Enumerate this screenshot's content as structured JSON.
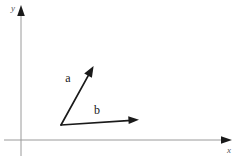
{
  "figure": {
    "type": "vector-diagram",
    "background_color": "#ffffff",
    "width": 242,
    "height": 162,
    "axes": {
      "color": "#9a9a9a",
      "origin": {
        "x": 21,
        "y": 140
      },
      "x_axis": {
        "label": "x",
        "label_position": {
          "x": 229,
          "y": 152
        },
        "start": {
          "x": 4,
          "y": 140
        },
        "end": {
          "x": 226,
          "y": 140
        },
        "arrow": "right"
      },
      "y_axis": {
        "label": "y",
        "label_position": {
          "x": 13,
          "y": 11
        },
        "start": {
          "x": 21,
          "y": 156
        },
        "end": {
          "x": 21,
          "y": 11
        },
        "arrow": "up"
      }
    },
    "vectors": [
      {
        "name": "a",
        "label": "a",
        "label_position": {
          "x": 68,
          "y": 82
        },
        "color": "#1a1a1a",
        "tail": {
          "x": 61,
          "y": 125
        },
        "head": {
          "x": 93,
          "y": 67
        },
        "stroke_width": 1.7
      },
      {
        "name": "b",
        "label": "b",
        "label_position": {
          "x": 94,
          "y": 115
        },
        "color": "#1a1a1a",
        "tail": {
          "x": 61,
          "y": 125
        },
        "head": {
          "x": 137,
          "y": 120
        },
        "stroke_width": 1.7
      }
    ]
  }
}
